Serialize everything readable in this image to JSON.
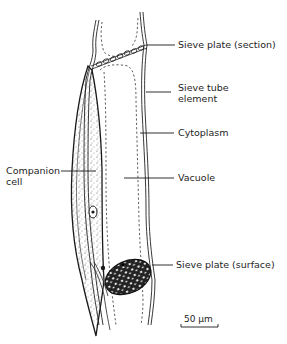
{
  "diagram": {
    "labels": {
      "sieve_plate_section": "Sieve plate (section)",
      "sieve_tube_element_line1": "Sieve tube",
      "sieve_tube_element_line2": "element",
      "cytoplasm": "Cytoplasm",
      "vacuole": "Vacuole",
      "companion_cell_line1": "Companion",
      "companion_cell_line2": "cell",
      "sieve_plate_surface": "Sieve plate (surface)"
    },
    "scale_bar": {
      "label": "50 µm"
    },
    "colors": {
      "ink": "#1e1e1e",
      "background": "#ffffff"
    }
  }
}
